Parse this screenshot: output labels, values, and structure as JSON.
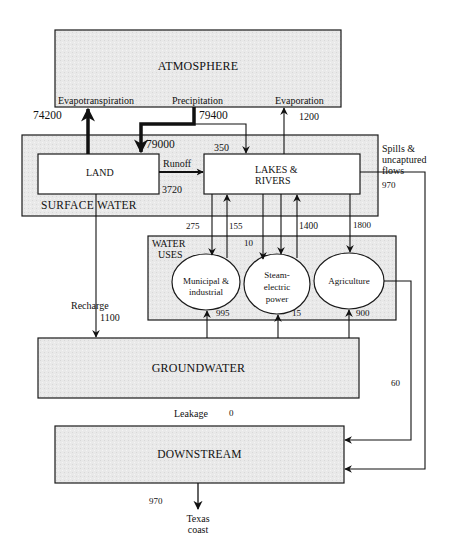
{
  "diagram": {
    "nodes": {
      "atmosphere": "ATMOSPHERE",
      "surface_water": "SURFACE WATER",
      "land": "LAND",
      "lakes_rivers_line1": "LAKES &",
      "lakes_rivers_line2": "RIVERS",
      "water_uses_line1": "WATER",
      "water_uses_line2": "USES",
      "municipal_line1": "Municipal &",
      "municipal_line2": "industrial",
      "steam_line1": "Steam-",
      "steam_line2": "electric",
      "steam_line3": "power",
      "agriculture": "Agriculture",
      "groundwater": "GROUNDWATER",
      "downstream": "DOWNSTREAM",
      "texas_line1": "Texas",
      "texas_line2": "coast"
    },
    "flow_labels": {
      "evapotranspiration": "Evapotranspiration",
      "precipitation": "Precipitation",
      "evaporation": "Evaporation",
      "runoff": "Runoff",
      "spills_line1": "Spills &",
      "spills_line2": "uncaptured",
      "spills_line3": "flows",
      "recharge": "Recharge",
      "leakage": "Leakage"
    },
    "flow_values": {
      "evapotranspiration": "74200",
      "precipitation_total": "79400",
      "precipitation_land": "79000",
      "precipitation_lakes": "350",
      "evaporation": "1200",
      "runoff": "3720",
      "spills": "970",
      "to_municipal": "275",
      "from_municipal": "155",
      "to_steam": "10",
      "from_steam": "1400",
      "to_agriculture": "1800",
      "gw_municipal": "995",
      "gw_steam": "15",
      "gw_agriculture": "900",
      "recharge": "1100",
      "agri_return": "60",
      "leakage": "0",
      "to_coast": "970"
    },
    "colors": {
      "box_fill": "#e8e8e8",
      "inner_fill": "#ffffff",
      "stroke": "#1a1a1a"
    }
  }
}
